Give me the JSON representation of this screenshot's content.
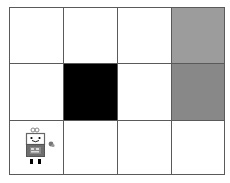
{
  "grid": {
    "rows": 3,
    "cols": 4,
    "cells": [
      {
        "row": 0,
        "col": 0,
        "type": "empty",
        "color": "#ffffff"
      },
      {
        "row": 0,
        "col": 1,
        "type": "empty",
        "color": "#ffffff"
      },
      {
        "row": 0,
        "col": 2,
        "type": "empty",
        "color": "#ffffff"
      },
      {
        "row": 0,
        "col": 3,
        "type": "goal",
        "color": "#9c9c9c"
      },
      {
        "row": 1,
        "col": 0,
        "type": "empty",
        "color": "#ffffff"
      },
      {
        "row": 1,
        "col": 1,
        "type": "wall",
        "color": "#000000"
      },
      {
        "row": 1,
        "col": 2,
        "type": "empty",
        "color": "#ffffff"
      },
      {
        "row": 1,
        "col": 3,
        "type": "pit",
        "color": "#888888"
      },
      {
        "row": 2,
        "col": 0,
        "type": "start",
        "color": "#ffffff"
      },
      {
        "row": 2,
        "col": 1,
        "type": "empty",
        "color": "#ffffff"
      },
      {
        "row": 2,
        "col": 2,
        "type": "empty",
        "color": "#ffffff"
      },
      {
        "row": 2,
        "col": 3,
        "type": "empty",
        "color": "#ffffff"
      }
    ]
  },
  "agent": {
    "row": 2,
    "col": 0,
    "icon": "robot-icon"
  },
  "colors": {
    "border": "#5a5a5a",
    "wall": "#000000",
    "goal": "#9c9c9c",
    "pit": "#888888"
  }
}
